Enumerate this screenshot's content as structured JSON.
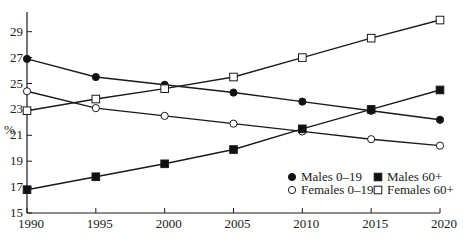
{
  "chart_data": {
    "type": "line",
    "title": "",
    "xlabel": "",
    "ylabel": "%",
    "x": [
      1990,
      1995,
      2000,
      2005,
      2010,
      2015,
      2020
    ],
    "xticks": [
      "1990",
      "1995",
      "2000",
      "2005",
      "2010",
      "2015",
      "2020"
    ],
    "yticks": [
      "15",
      "17",
      "19",
      "21",
      "23",
      "25",
      "27",
      "29"
    ],
    "ylim": [
      15,
      30.5
    ],
    "xlim": [
      1990,
      2020
    ],
    "grid": false,
    "legend_position": "lower right",
    "series": [
      {
        "name": "Males 0–19",
        "marker": "filled-circle",
        "values": [
          26.9,
          25.5,
          24.9,
          24.3,
          23.6,
          22.9,
          22.2
        ]
      },
      {
        "name": "Females 0–19",
        "marker": "open-circle",
        "values": [
          24.4,
          23.1,
          22.5,
          21.9,
          21.3,
          20.7,
          20.2
        ]
      },
      {
        "name": "Males 60+",
        "marker": "filled-square",
        "values": [
          16.8,
          17.8,
          18.8,
          19.9,
          21.5,
          23.0,
          24.5
        ]
      },
      {
        "name": "Females 60+",
        "marker": "open-square",
        "values": [
          22.9,
          23.8,
          24.6,
          25.5,
          27.0,
          28.5,
          29.9
        ]
      }
    ]
  },
  "legend": {
    "items": [
      {
        "label": "Males 0–19",
        "marker": "filled-circle"
      },
      {
        "label": "Males 60+",
        "marker": "filled-square"
      },
      {
        "label": "Females 0–19",
        "marker": "open-circle"
      },
      {
        "label": "Females 60+",
        "marker": "open-square"
      }
    ]
  },
  "colors": {
    "line": "#1a1a1a",
    "marker_fill": "#111111",
    "open_fill": "#ffffff"
  }
}
